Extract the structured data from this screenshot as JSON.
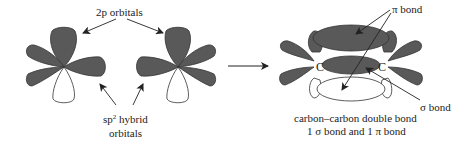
{
  "diagram": {
    "colors": {
      "lobe_fill": "#595959",
      "lobe_stroke": "#333333",
      "empty_lobe_fill": "#ffffff",
      "line": "#222222",
      "background": "#ffffff"
    },
    "labels": {
      "p_orbitals": "2p orbitals",
      "sp2_line1_base": "sp",
      "sp2_line1_sup": "2",
      "sp2_line1_rest": " hybrid",
      "sp2_line2": "orbitals",
      "pi_bond": "π bond",
      "sigma_bond": "σ bond",
      "carbon_left": "C",
      "carbon_right": "C",
      "caption_line1": "carbon–carbon double bond",
      "caption_line2": "1 σ bond and 1 π bond"
    },
    "nodes": [
      {
        "id": "carbon-left-atom",
        "orbitals": [
          "2p (up, shaded)",
          "2p (down, unshaded)",
          "sp2 left-upper",
          "sp2 left-lower",
          "sp2 right"
        ]
      },
      {
        "id": "carbon-right-atom",
        "orbitals": [
          "2p (up, shaded)",
          "2p (down, unshaded)",
          "sp2 left",
          "sp2 right-upper",
          "sp2 right-lower"
        ]
      },
      {
        "id": "ethylene-double-bond",
        "components": [
          "pi bond (top lobe, shaded)",
          "sigma bond (center, shaded)",
          "pi bond (bottom lobe, unshaded)",
          "C",
          "C"
        ]
      }
    ],
    "edges": [
      {
        "from": "p_orbitals_label",
        "to": "carbon-left-atom 2p lobe",
        "type": "arrow"
      },
      {
        "from": "p_orbitals_label",
        "to": "carbon-right-atom 2p lobe",
        "type": "arrow"
      },
      {
        "from": "sp2_label",
        "to": "carbon-left-atom sp2 right lobe",
        "type": "arrow"
      },
      {
        "from": "sp2_label",
        "to": "carbon-right-atom sp2 left lobe",
        "type": "arrow"
      },
      {
        "from": "separated atoms",
        "to": "double bond",
        "type": "reaction-arrow"
      },
      {
        "from": "pi_bond_label",
        "to": "pi top lobe",
        "type": "arrow"
      },
      {
        "from": "pi_bond_label",
        "to": "pi bottom lobe",
        "type": "arrow"
      },
      {
        "from": "sigma_bond_label",
        "to": "sigma bond",
        "type": "arrow"
      }
    ]
  }
}
